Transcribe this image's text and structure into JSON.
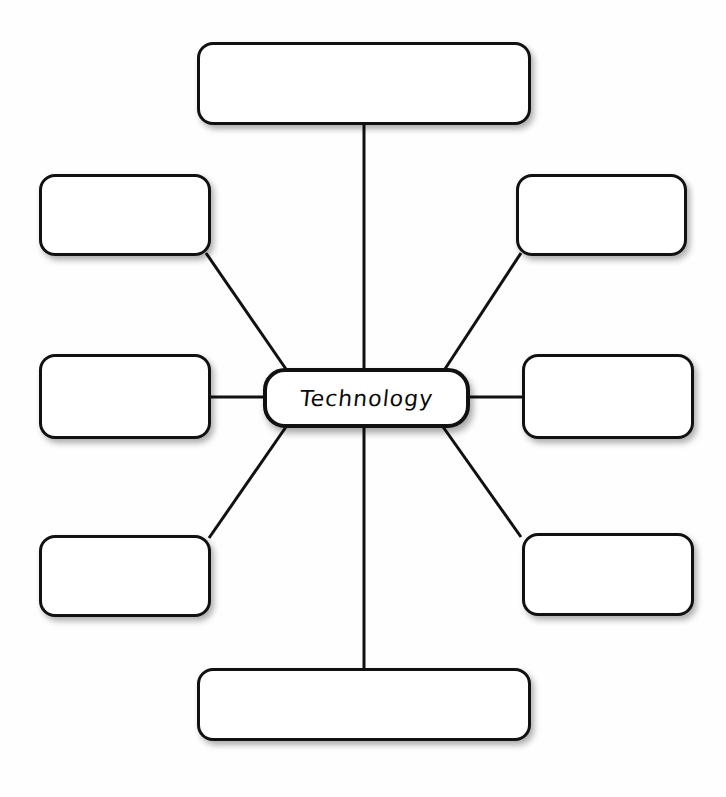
{
  "diagram": {
    "type": "spider-web-concept-map",
    "title": "",
    "background_color": "#fefefe",
    "stroke_color": "#111111",
    "fill_color": "#ffffff",
    "center": {
      "id": "center",
      "label": "Technology",
      "x": 263,
      "y": 368,
      "width": 207,
      "height": 60
    },
    "branches": [
      {
        "id": "branch-top",
        "label": "",
        "position": "top",
        "x": 197,
        "y": 42,
        "width": 334,
        "height": 83
      },
      {
        "id": "branch-top-left",
        "label": "",
        "position": "top-left",
        "x": 39,
        "y": 174,
        "width": 172,
        "height": 82
      },
      {
        "id": "branch-top-right",
        "label": "",
        "position": "top-right",
        "x": 516,
        "y": 174,
        "width": 171,
        "height": 82
      },
      {
        "id": "branch-mid-left",
        "label": "",
        "position": "mid-left",
        "x": 39,
        "y": 354,
        "width": 172,
        "height": 85
      },
      {
        "id": "branch-mid-right",
        "label": "",
        "position": "mid-right",
        "x": 522,
        "y": 354,
        "width": 172,
        "height": 85
      },
      {
        "id": "branch-bottom-left",
        "label": "",
        "position": "bottom-left",
        "x": 39,
        "y": 535,
        "width": 172,
        "height": 82
      },
      {
        "id": "branch-bottom-right",
        "label": "",
        "position": "bottom-right",
        "x": 522,
        "y": 533,
        "width": 172,
        "height": 83
      },
      {
        "id": "branch-bottom",
        "label": "",
        "position": "bottom",
        "x": 197,
        "y": 668,
        "width": 334,
        "height": 73
      }
    ],
    "connectors": [
      {
        "id": "connector-top",
        "from": "center",
        "to": "branch-top",
        "x1": 364,
        "y1": 368,
        "x2": 364,
        "y2": 125
      },
      {
        "id": "connector-top-left",
        "from": "center",
        "to": "branch-top-left",
        "x1": 288,
        "y1": 372,
        "x2": 206,
        "y2": 253
      },
      {
        "id": "connector-top-right",
        "from": "center",
        "to": "branch-top-right",
        "x1": 443,
        "y1": 372,
        "x2": 521,
        "y2": 253
      },
      {
        "id": "connector-mid-left",
        "from": "center",
        "to": "branch-mid-left",
        "x1": 263,
        "y1": 397,
        "x2": 211,
        "y2": 397
      },
      {
        "id": "connector-mid-right",
        "from": "center",
        "to": "branch-mid-right",
        "x1": 470,
        "y1": 397,
        "x2": 522,
        "y2": 397
      },
      {
        "id": "connector-bottom-left",
        "from": "center",
        "to": "branch-bottom-left",
        "x1": 288,
        "y1": 424,
        "x2": 209,
        "y2": 538
      },
      {
        "id": "connector-bottom-right",
        "from": "center",
        "to": "branch-bottom-right",
        "x1": 441,
        "y1": 424,
        "x2": 521,
        "y2": 537
      },
      {
        "id": "connector-bottom",
        "from": "center",
        "to": "branch-bottom",
        "x1": 364,
        "y1": 424,
        "x2": 364,
        "y2": 668
      }
    ]
  }
}
